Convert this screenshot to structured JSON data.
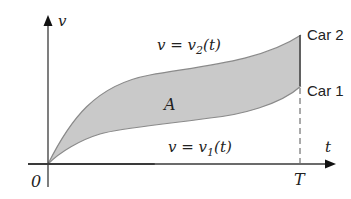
{
  "diagram": {
    "axes": {
      "y_label": "v",
      "x_label": "t",
      "origin_label": "0",
      "t_marker_label": "T"
    },
    "curves": {
      "upper_label": "v = v₂(t)",
      "upper_prefix": "v = v",
      "upper_sub": "2",
      "upper_suffix": "(t)",
      "lower_prefix": "v = v",
      "lower_sub": "1",
      "lower_suffix": "(t)",
      "upper_end_label": "Car 2",
      "lower_end_label": "Car 1"
    },
    "region_label": "A",
    "colors": {
      "fill": "#c9c9c9",
      "curve": "#8a8a8a",
      "axis": "#3a3a3a",
      "text": "#222222"
    }
  }
}
